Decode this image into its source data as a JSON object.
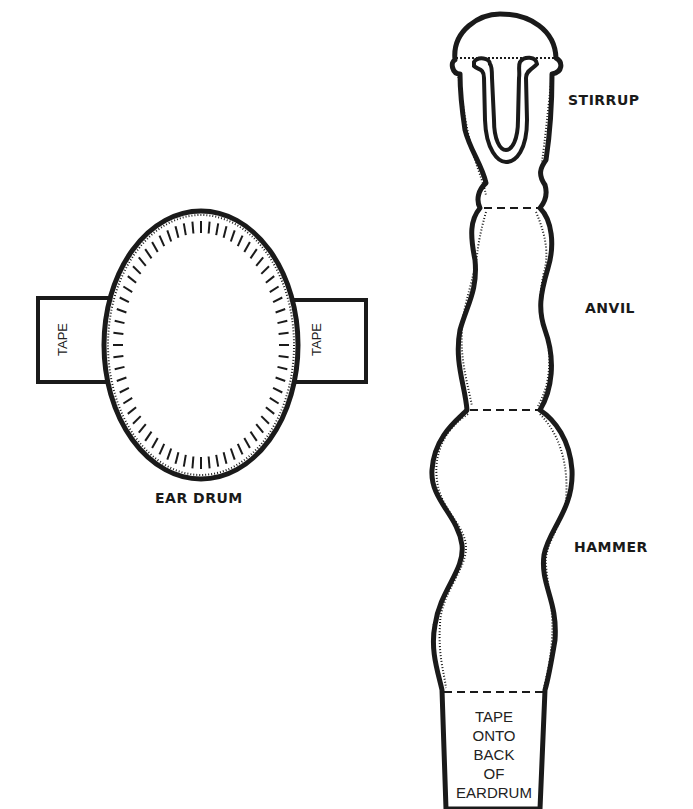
{
  "diagram": {
    "ear_drum": {
      "label": "EAR DRUM",
      "tabs": [
        {
          "position": "left",
          "label": "TAPE"
        },
        {
          "position": "right",
          "label": "TAPE"
        }
      ]
    },
    "ossicles": {
      "parts": [
        {
          "name": "stirrup",
          "label": "STIRRUP"
        },
        {
          "name": "anvil",
          "label": "ANVIL"
        },
        {
          "name": "hammer",
          "label": "HAMMER"
        }
      ],
      "tab_instruction_lines": [
        "TAPE",
        "ONTO",
        "BACK",
        "OF",
        "EARDRUM"
      ]
    },
    "colors": {
      "outline": "#1a1a1a",
      "background": "#ffffff"
    }
  }
}
